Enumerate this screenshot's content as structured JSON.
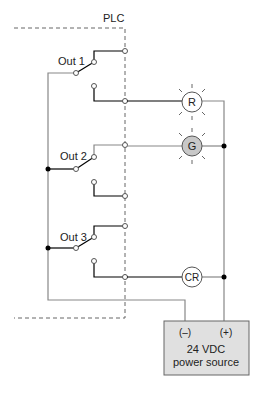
{
  "diagram": {
    "plc_label": "PLC",
    "outputs": [
      {
        "label": "Out 1"
      },
      {
        "label": "Out 2"
      },
      {
        "label": "Out 3"
      }
    ],
    "loads": [
      {
        "label": "R",
        "type": "pilot-light",
        "lit": false,
        "fill": "#ffffff"
      },
      {
        "label": "G",
        "type": "pilot-light",
        "lit": true,
        "fill": "#c8c8c8"
      },
      {
        "label": "CR",
        "type": "control-relay-coil",
        "fill": "#ffffff"
      }
    ],
    "power_source": {
      "minus": "(–)",
      "plus": "(+)",
      "line1": "24 VDC",
      "line2": "power source",
      "fill": "#e0e0e0"
    }
  }
}
